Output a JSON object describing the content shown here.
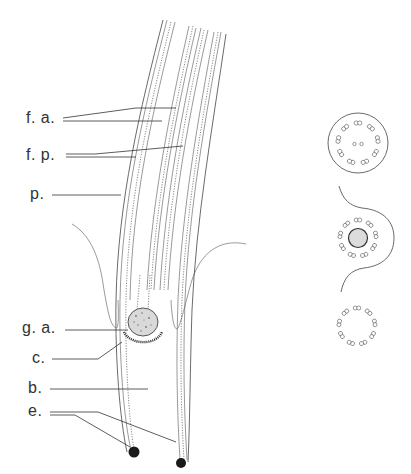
{
  "figure": {
    "labels": [
      {
        "id": "fa",
        "text": "f. a.",
        "x": 26,
        "y": 112
      },
      {
        "id": "fp",
        "text": "f. p.",
        "x": 26,
        "y": 149
      },
      {
        "id": "p",
        "text": "p.",
        "x": 30,
        "y": 187
      },
      {
        "id": "ga",
        "text": "g. a.",
        "x": 22,
        "y": 318
      },
      {
        "id": "c",
        "text": "c.",
        "x": 32,
        "y": 348
      },
      {
        "id": "b",
        "text": "b.",
        "x": 28,
        "y": 378
      },
      {
        "id": "e",
        "text": "e.",
        "x": 28,
        "y": 408
      }
    ],
    "cross_sections": [
      {
        "id": "section-top",
        "description": "9+2 axoneme cross-section inside membrane",
        "outer_doublets": 9,
        "central_singlets": 2
      },
      {
        "id": "section-middle",
        "description": "9 doublets around basal granule with cytoplasmic invagination",
        "outer_doublets": 9
      },
      {
        "id": "section-bottom",
        "description": "9 triplets/doublets ring without membrane",
        "outer_doublets": 9
      }
    ],
    "colors": {
      "ink": "#333333",
      "background": "#ffffff"
    }
  }
}
